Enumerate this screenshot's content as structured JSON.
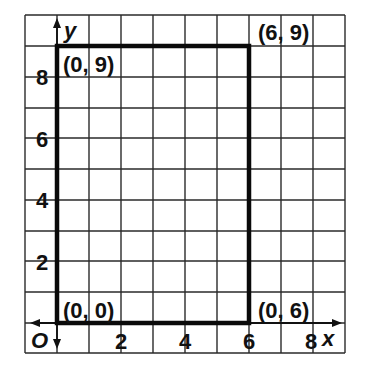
{
  "diagram": {
    "type": "coordinate-grid",
    "axes": {
      "x_label": "x",
      "y_label": "y",
      "origin_label": "O",
      "x_ticks": [
        "2",
        "4",
        "6",
        "8"
      ],
      "y_ticks": [
        "2",
        "4",
        "6",
        "8"
      ]
    },
    "rectangle": {
      "vertices": [
        {
          "label": "(0, 0)",
          "x": 0,
          "y": 0
        },
        {
          "label": "(0, 6)",
          "x": 6,
          "y": 0
        },
        {
          "label": "(6, 9)",
          "x": 6,
          "y": 9
        },
        {
          "label": "(0, 9)",
          "x": 0,
          "y": 9
        }
      ]
    },
    "grid": {
      "x_range": [
        -1,
        9
      ],
      "y_range": [
        -1,
        10
      ]
    },
    "colors": {
      "grid": "#2a2a2a",
      "outline": "#0a0a0a",
      "background": "#ffffff"
    }
  }
}
